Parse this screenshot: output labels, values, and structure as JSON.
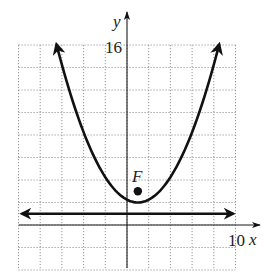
{
  "chart_data": {
    "type": "line",
    "title": "",
    "xlabel": "x",
    "ylabel": "y",
    "xlim": [
      -10,
      10
    ],
    "ylim": [
      -4,
      16
    ],
    "grid": true,
    "grid_step": {
      "x": 2,
      "y": 2
    },
    "tick_labels": {
      "x": [
        "10"
      ],
      "y": [
        "16"
      ]
    },
    "series": [
      {
        "name": "parabola",
        "equation": "(x-1)^2 = 4(y-2)",
        "vertex": [
          1,
          2
        ],
        "x_range": [
          -6.5,
          8.5
        ],
        "arrows": "both ends"
      },
      {
        "name": "directrix",
        "equation": "y = 1",
        "x_range": [
          -9.7,
          9.8
        ],
        "arrows": "both ends"
      }
    ],
    "points": [
      {
        "label": "F",
        "x": 1,
        "y": 3,
        "role": "focus"
      }
    ],
    "legend": null
  },
  "labels": {
    "x_axis": "x",
    "y_axis": "y",
    "x_tick": "10",
    "y_tick": "16",
    "focus": "F"
  }
}
